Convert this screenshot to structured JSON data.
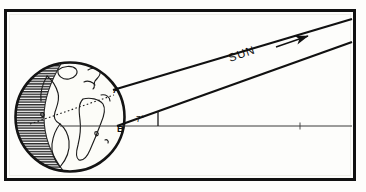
{
  "figure": {
    "type": "astronomy-diagram",
    "frame": {
      "border_color": "#111111",
      "background_color": "#fdfdfb",
      "x": 5,
      "y": 10,
      "width": 350,
      "height": 170
    },
    "earth": {
      "label": "earth-globe",
      "center_x": 70,
      "center_y": 117,
      "radius": 55,
      "outline_color": "#151515",
      "day_side_color": "#fbfbf6",
      "night_side_color": "#4a4a4a",
      "night_side_description": "shaded hatched hemisphere on the left (night side)",
      "continents_visible": [
        "North America",
        "South America",
        "Africa",
        "Europe",
        "Greenland"
      ]
    },
    "points": [
      {
        "id": "A",
        "label": "A",
        "x": 116,
        "y": 89,
        "description": "upper point on Earth's limb where the upper sun ray is tangent"
      },
      {
        "id": "B",
        "label": "B",
        "x": 119,
        "y": 127,
        "description": "lower point on Earth's limb where the lower sun ray meets the horizontal reference line"
      }
    ],
    "rays": {
      "label": "SUN",
      "ray_label_text": "SUN",
      "ray_label_rotation_deg": -19,
      "count": 2,
      "color": "#111111",
      "direction_description": "parallel rays arriving from the upper right",
      "upper_ray": {
        "x1": 113,
        "y1": 90,
        "x2": 352,
        "y2": 19
      },
      "lower_ray": {
        "x1": 117,
        "y1": 126,
        "x2": 352,
        "y2": 42
      },
      "arrow": {
        "name": "ray-direction-arrow",
        "x1": 278,
        "y1": 47,
        "x2": 312,
        "y2": 36,
        "description": "solid arrowhead pointing up-right along the ray"
      }
    },
    "horizontal_line": {
      "name": "horizon-reference-line",
      "x1": 60,
      "y1": 126,
      "x2": 352,
      "y2": 126,
      "color": "#333333",
      "style": "thin solid"
    },
    "angle": {
      "value": "7",
      "unit": "°",
      "label": "7°",
      "label_x": 140,
      "label_y": 120,
      "vertex_x": 117,
      "vertex_y": 126,
      "description": "angle between the lower sun ray and the horizontal reference line"
    },
    "tick_mark": {
      "name": "angle-tick-line",
      "x1": 158,
      "y1": 126,
      "x2": 158,
      "y2": 111
    },
    "terminator": {
      "name": "terminator-dashed-line",
      "x1": 30,
      "y1": 124,
      "x2": 114,
      "y2": 95,
      "style": "dotted",
      "description": "dotted line across the globe from the night side toward point A"
    }
  }
}
